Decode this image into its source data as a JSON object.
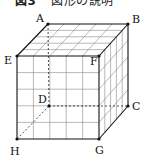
{
  "figure": {
    "number": "図3",
    "caption": "図形の説明",
    "type": "cube",
    "grid_divisions": 5,
    "vertices": {
      "A": {
        "label": "A",
        "x": 48,
        "y": 24
      },
      "B": {
        "label": "B",
        "x": 128,
        "y": 24
      },
      "C": {
        "label": "C",
        "x": 128,
        "y": 106
      },
      "D": {
        "label": "D",
        "x": 49,
        "y": 106
      },
      "E": {
        "label": "E",
        "x": 17,
        "y": 56
      },
      "F": {
        "label": "F",
        "x": 99,
        "y": 56
      },
      "G": {
        "label": "G",
        "x": 99,
        "y": 139
      },
      "H": {
        "label": "H",
        "x": 17,
        "y": 139
      }
    },
    "hidden_edges": [
      "DA",
      "DC",
      "DH"
    ],
    "colors": {
      "edge": "#111111",
      "grid": "#777777",
      "background": "#ffffff"
    }
  }
}
